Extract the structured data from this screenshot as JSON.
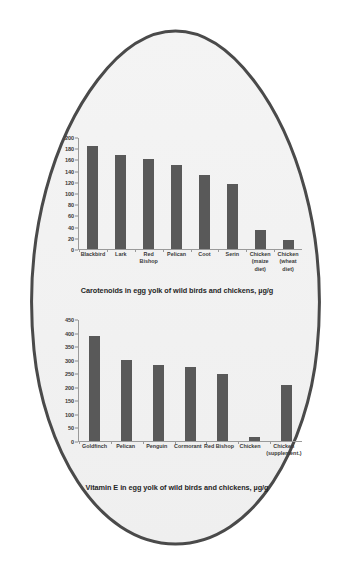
{
  "figure": {
    "shape": "egg-outline",
    "outline_color": "#4a4a4a",
    "fill_color": "#f2f2f2",
    "bar_color": "#595959",
    "axis_color": "#9a9a9a"
  },
  "chart_data": [
    {
      "id": "carotenoids",
      "type": "bar",
      "title": "Carotenoids in egg yolk of wild birds and chickens, µg/g",
      "xlabel": "",
      "ylabel": "",
      "ylim": [
        0,
        200
      ],
      "yticks": [
        0,
        20,
        40,
        60,
        80,
        100,
        120,
        140,
        160,
        180,
        200
      ],
      "grid": false,
      "legend": "none",
      "categories": [
        "Blackbird",
        "Lark",
        "Red Bishop",
        "Pelican",
        "Coot",
        "Serin",
        "Chicken (maize diet)",
        "Chicken (wheat diet)"
      ],
      "values": [
        185,
        169,
        163,
        152,
        133,
        117,
        34,
        17
      ]
    },
    {
      "id": "vitamin-e",
      "type": "bar",
      "title": "Vitamin E in egg yolk of wild birds and chickens, µg/g",
      "xlabel": "",
      "ylabel": "",
      "ylim": [
        0,
        450
      ],
      "yticks": [
        0,
        50,
        100,
        150,
        200,
        250,
        300,
        350,
        400,
        450
      ],
      "grid": false,
      "legend": "none",
      "categories": [
        "Goldfinch",
        "Pelican",
        "Penguin",
        "Cormorant",
        "Red Bishop",
        "Chicken",
        "Chicken (supplement.)"
      ],
      "values": [
        390,
        300,
        284,
        276,
        248,
        15,
        210
      ]
    }
  ]
}
